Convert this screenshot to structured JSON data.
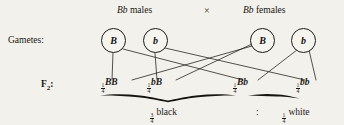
{
  "figure": {
    "type": "genetics-monohybrid-cross-diagram",
    "background_color": "#f3f1ec",
    "ink_color": "#17150f"
  },
  "parents": {
    "male": {
      "genotype": "Bb",
      "text": " males"
    },
    "cross_symbol": "×",
    "female": {
      "genotype": "Bb",
      "text": " females"
    }
  },
  "rows": {
    "gametes_label": "Gametes:",
    "f2_label": "F",
    "f2_subscript": "2",
    "f2_colon": ":"
  },
  "gametes": [
    {
      "allele": "B",
      "parent": "male"
    },
    {
      "allele": "b",
      "parent": "male"
    },
    {
      "allele": "B",
      "parent": "female"
    },
    {
      "allele": "b",
      "parent": "female"
    }
  ],
  "f2_offspring": [
    {
      "numerator": "1",
      "denominator": "4",
      "genotype": "BB"
    },
    {
      "numerator": "1",
      "denominator": "4",
      "genotype": "bB"
    },
    {
      "numerator": "1",
      "denominator": "4",
      "genotype": "Bb"
    },
    {
      "numerator": "1",
      "denominator": "4",
      "genotype": "bb"
    }
  ],
  "summary": {
    "black": {
      "numerator": "3",
      "denominator": "4",
      "label": "black"
    },
    "ratio_separator": ":",
    "white": {
      "numerator": "1",
      "denominator": "4",
      "label": "white"
    }
  }
}
